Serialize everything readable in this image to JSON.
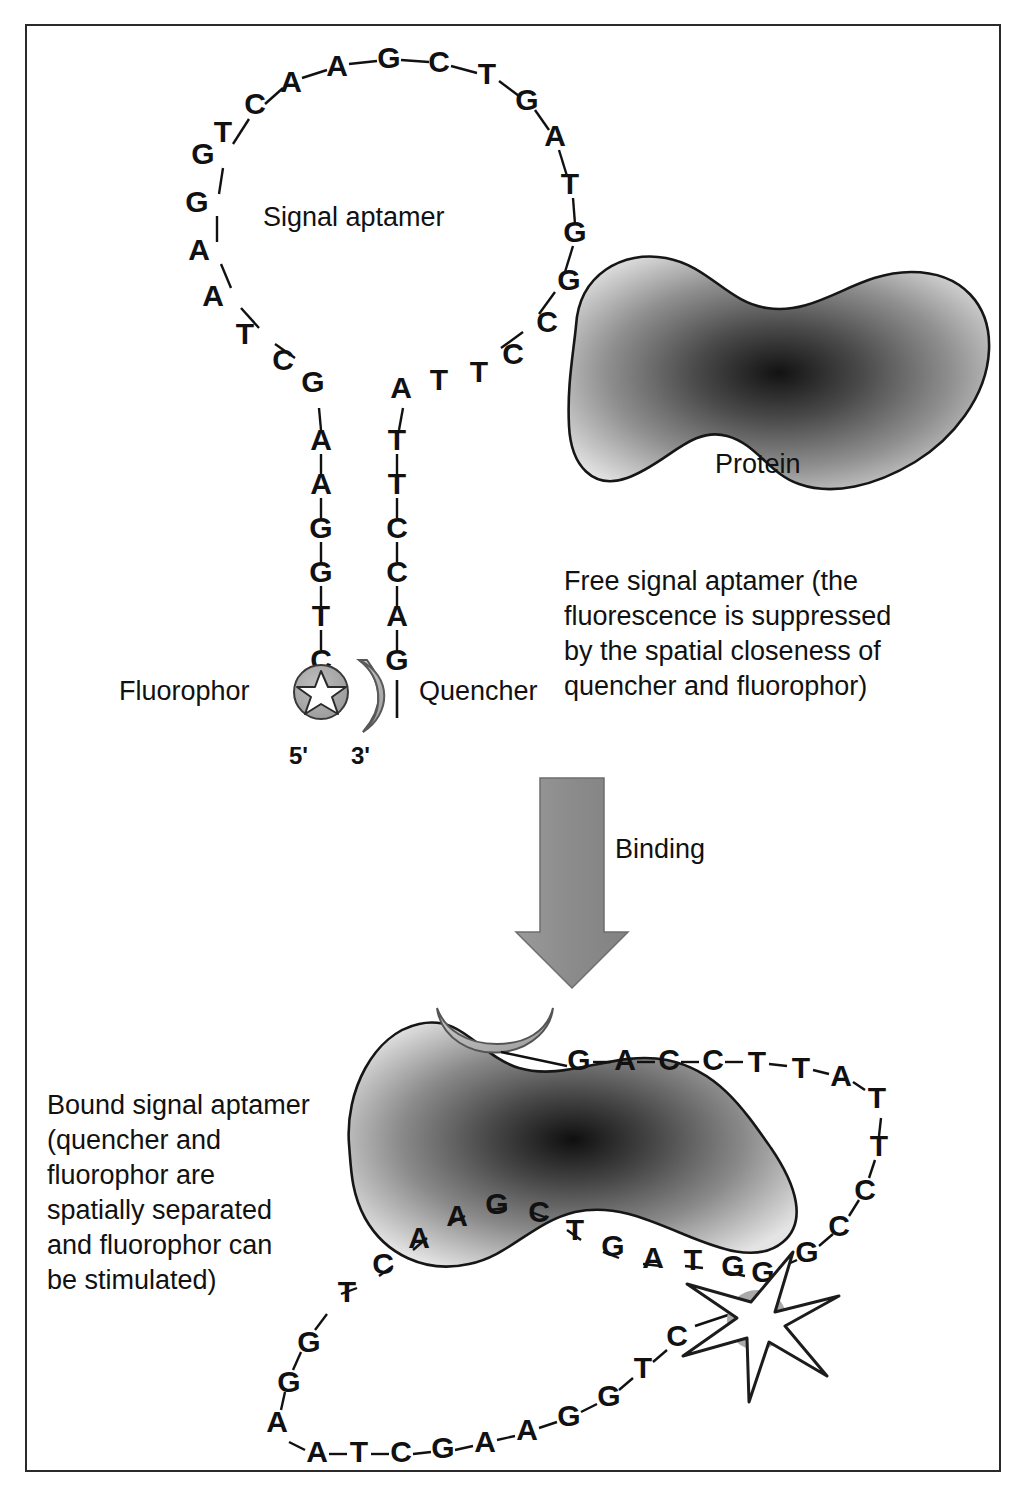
{
  "figure": {
    "border_color": "#2a2a2a",
    "background": "#ffffff"
  },
  "labels": {
    "signal_aptamer": "Signal aptamer",
    "protein": "Protein",
    "fluorophor": "Fluorophor",
    "quencher": "Quencher",
    "five_prime": "5'",
    "three_prime": "3'",
    "binding": "Binding"
  },
  "captions": {
    "free": "Free signal aptamer (the\nfluorescence is suppressed\nby the spatial closeness of\nquencher and fluorophor)",
    "bound": "Bound signal aptamer\n(quencher and\nfluorophor are\nspatially separated\nand fluorophor can\nbe stimulated)"
  },
  "colors": {
    "ink": "#111111",
    "protein_light": "#d9d9d9",
    "protein_dark": "#1e1e1e",
    "quencher_fill": "#b5b5b5",
    "fluorophore_fill": "#a8a8a8",
    "arrow_fill": "#8f8f8f",
    "star_fill": "#ffffff"
  },
  "free_aptamer": {
    "loop_top": [
      "T",
      "C",
      "A",
      "A",
      "G",
      "C",
      "T",
      "G",
      "A"
    ],
    "left_arm": [
      "G",
      "G",
      "A",
      "A",
      "T",
      "C",
      "G"
    ],
    "right_arm": [
      "T",
      "G",
      "G",
      "C",
      "C",
      "T",
      "T",
      "A"
    ],
    "left_stem": [
      "A",
      "A",
      "G",
      "G",
      "T",
      "C"
    ],
    "right_stem": [
      "T",
      "T",
      "C",
      "C",
      "A",
      "G"
    ],
    "full_sequence": "C T G G A A T C G A A G G T C  /  G A C C T T A T T C C G G T A G T C A A"
  },
  "bound_aptamer": {
    "top_strand": [
      "G",
      "A",
      "C",
      "C",
      "T",
      "T",
      "A",
      "T"
    ],
    "right_descend": [
      "T",
      "C",
      "C",
      "G",
      "G"
    ],
    "loop_upper": [
      "A",
      "T",
      "G",
      "G"
    ],
    "loop_mid": [
      "A",
      "A",
      "G",
      "C",
      "T",
      "G"
    ],
    "left_descend": [
      "T",
      "C",
      "A"
    ],
    "lower_left": [
      "G",
      "G",
      "A"
    ],
    "bottom_strand": [
      "A",
      "T",
      "C",
      "G",
      "A",
      "A",
      "G",
      "G",
      "T",
      "C"
    ]
  },
  "elements": {
    "fluorophore_free": "gray circle with small white star",
    "fluorophore_bound": "large white emitting star over gray circle",
    "quencher_shape": "gray crescent",
    "arrow": "thick downward gray block arrow"
  }
}
